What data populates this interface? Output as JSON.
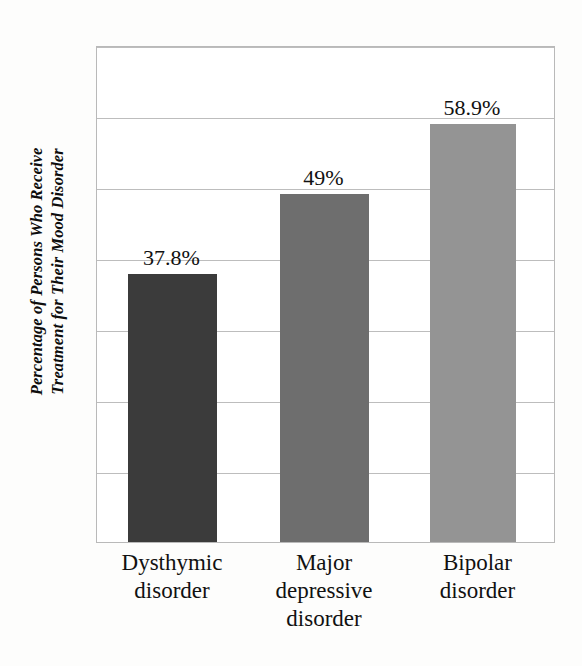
{
  "chart_data": {
    "type": "bar",
    "title": "",
    "subtitle": "",
    "xlabel": "",
    "ylabel_line1": "Percentage of Persons Who Receive",
    "ylabel_line2": "Treatment for Their Mood Disorder",
    "ylabel": "Percentage of Persons Who Receive Treatment for Their Mood Disorder",
    "categories": [
      "Dysthymic disorder",
      "Major depressive disorder",
      "Bipolar disorder"
    ],
    "category_lines": [
      [
        "Dysthymic",
        "disorder"
      ],
      [
        "Major",
        "depressive",
        "disorder"
      ],
      [
        "Bipolar",
        "disorder"
      ]
    ],
    "values": [
      37.8,
      49,
      58.9
    ],
    "value_labels": [
      "37.8%",
      "49%",
      "58.9%"
    ],
    "bar_colors": [
      "#3b3b3b",
      "#6e6e6e",
      "#949494"
    ],
    "ylim": [
      0,
      70
    ],
    "gridline_values": [
      70,
      60,
      50,
      40,
      30,
      20,
      10
    ],
    "grid": true,
    "axis_tick_labels": [],
    "legend": [],
    "legend_position": "none",
    "frame_color": "#b9b9b9",
    "grid_color": "#bdbdbd",
    "background": "#ffffff"
  }
}
